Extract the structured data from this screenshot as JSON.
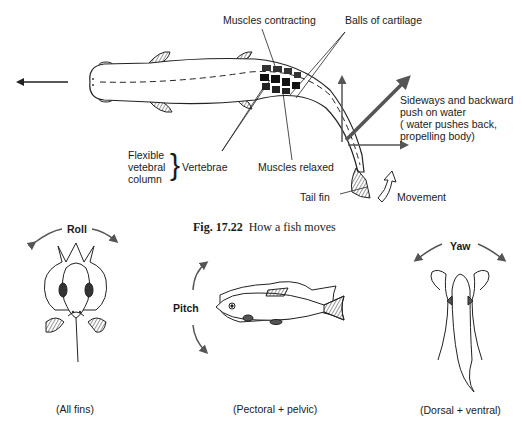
{
  "figure": {
    "caption_number": "Fig. 17.22",
    "caption_text": "How a fish moves"
  },
  "top_diagram": {
    "labels": {
      "muscles_contracting": "Muscles contracting",
      "balls_of_cartilage": "Balls of cartilage",
      "flexible_column_line1": "Flexible",
      "flexible_column_line2": "vetebral",
      "flexible_column_line3": "column",
      "vertebrae": "Vertebrae",
      "muscles_relaxed": "Muscles relaxed",
      "push_line1": "Sideways and backward",
      "push_line2": "push on water",
      "push_line3": "( water pushes back,",
      "push_line4": "propelling body)",
      "tail_fin": "Tail fin",
      "movement": "Movement"
    }
  },
  "bottom_diagrams": [
    {
      "name": "Roll",
      "fins": "(All fins)"
    },
    {
      "name": "Pitch",
      "fins": "(Pectoral + pelvic)"
    },
    {
      "name": "Yaw",
      "fins": "(Dorsal + ventral)"
    }
  ]
}
